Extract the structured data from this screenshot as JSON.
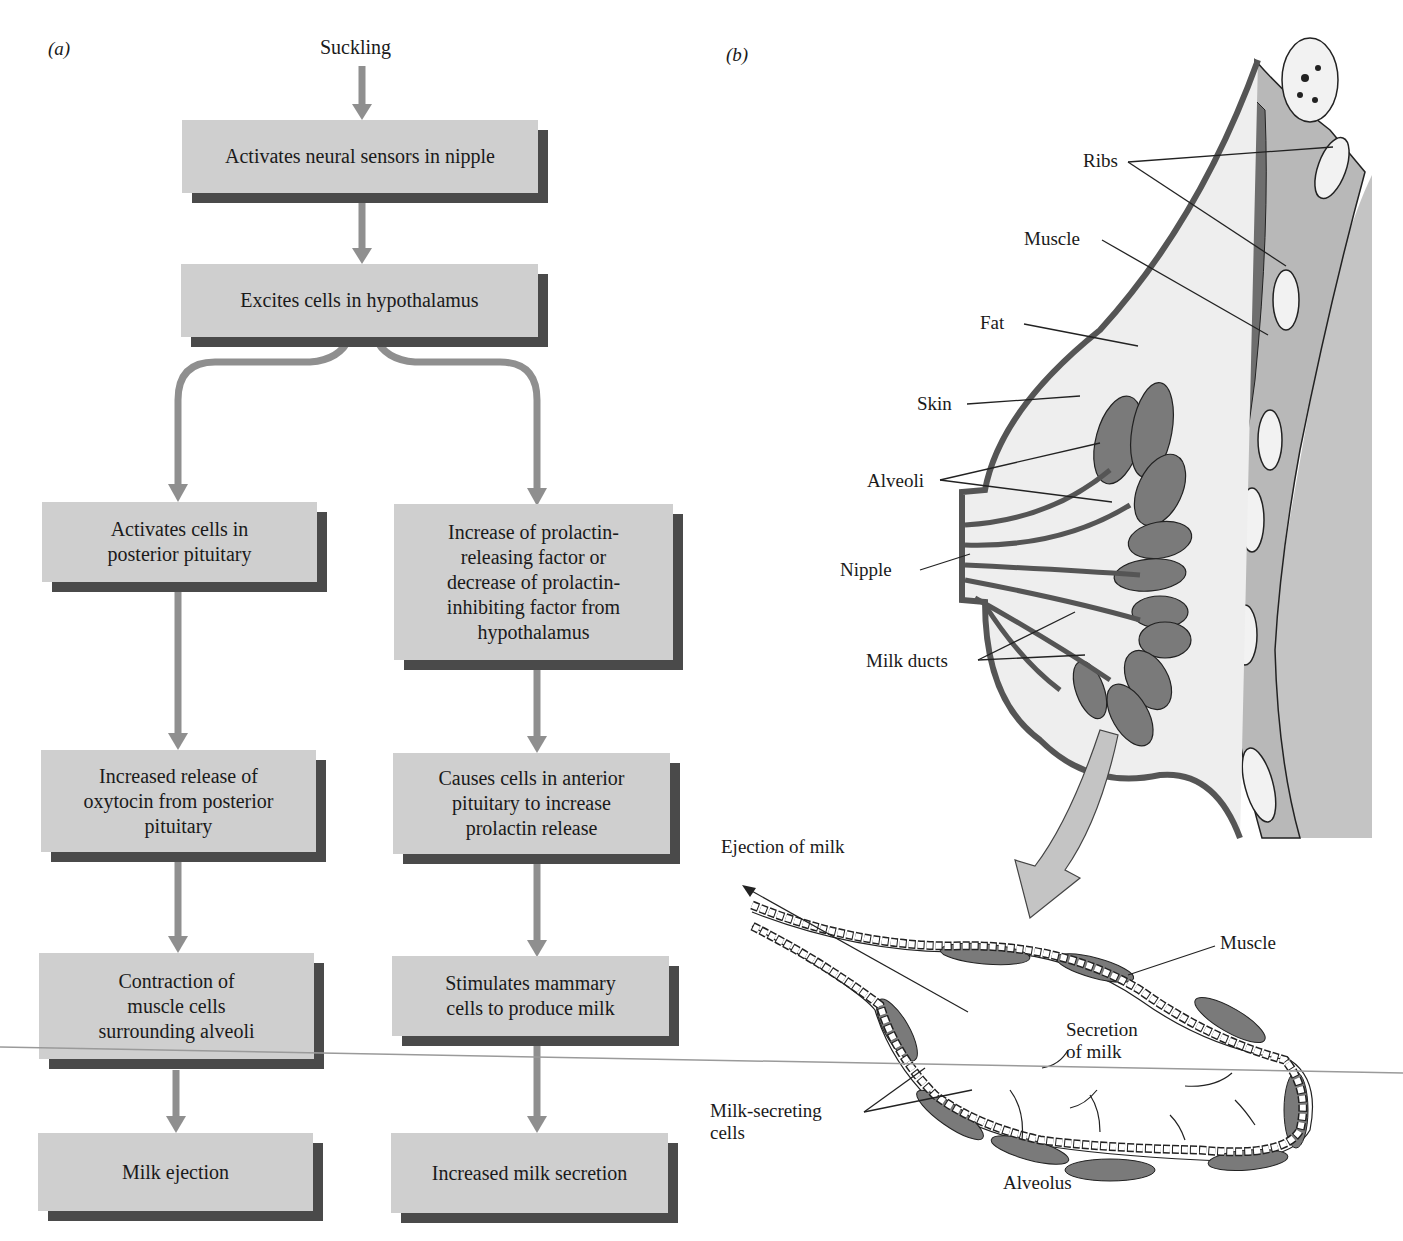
{
  "panels": {
    "a_label": "(a)",
    "b_label": "(b)"
  },
  "flowchart": {
    "start": "Suckling",
    "boxes": {
      "neural_sensors": "Activates neural sensors in nipple",
      "hypothalamus": "Excites cells in hypothalamus",
      "posterior_pituitary": [
        "Activates cells in",
        "posterior pituitary"
      ],
      "prolactin_factor": [
        "Increase of prolactin-",
        "releasing factor or",
        "decrease of prolactin-",
        "inhibiting factor from",
        "hypothalamus"
      ],
      "oxytocin_release": [
        "Increased release of",
        "oxytocin from posterior",
        "pituitary"
      ],
      "anterior_pituitary": [
        "Causes cells in anterior",
        "pituitary to increase",
        "prolactin release"
      ],
      "muscle_contraction": [
        "Contraction of",
        "muscle cells",
        "surrounding alveoli"
      ],
      "mammary_cells": [
        "Stimulates mammary",
        "cells to produce milk"
      ],
      "milk_ejection": "Milk ejection",
      "milk_secretion": "Increased milk secretion"
    },
    "colors": {
      "box_fill": "#cfcfcf",
      "box_shadow": "#4a4a4a",
      "arrow": "#8f8f8f"
    }
  },
  "anatomy": {
    "breast_labels": {
      "ribs": "Ribs",
      "muscle": "Muscle",
      "fat": "Fat",
      "skin": "Skin",
      "alveoli": "Alveoli",
      "nipple": "Nipple",
      "milk_ducts": "Milk ducts"
    },
    "alveolus_labels": {
      "ejection": "Ejection of milk",
      "muscle": "Muscle",
      "secretion": [
        "Secretion",
        "of milk"
      ],
      "milk_secreting": [
        "Milk-secreting",
        "cells"
      ],
      "alveolus": "Alveolus"
    },
    "colors": {
      "chest_wall": "#c4c4c4",
      "tissue_dark": "#6e6e6e",
      "tissue_mid": "#8a8a8a",
      "fat_fill": "#eeeeee",
      "outline": "#222222"
    }
  }
}
